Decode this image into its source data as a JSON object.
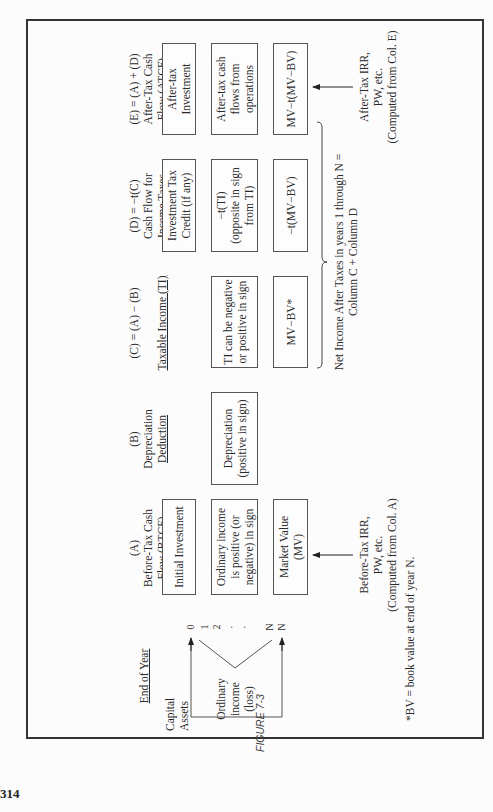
{
  "page_number": "314",
  "figure_label": "FIGURE 7-3",
  "headers": {
    "end_of_year": "End of Year",
    "a": [
      "(A)",
      "Before-Tax Cash",
      "Flow (BTCF)"
    ],
    "b": [
      "(B)",
      "Depreciation",
      "Deduction"
    ],
    "c": [
      "(C) = (A) − (B)",
      "",
      "Taxable Income (TI)"
    ],
    "d": [
      "(D) = −t(C)",
      "Cash Flow for",
      "Income Taxes"
    ],
    "e": [
      "(E) = (A) + (D)",
      "After-Tax Cash",
      "Flow (ATCF)"
    ]
  },
  "years": [
    "0",
    "1",
    "2",
    "·",
    "·",
    "N",
    "N"
  ],
  "capital_assets": "Capital\nAssets",
  "ordinary_income": "Ordinary\nincome\n(loss)",
  "boxes": {
    "a0": "Initial Investment",
    "a1": "Ordinary income\nis positive (or\nnegative) in sign",
    "aN": "Market Value\n(MV)",
    "b1": "Depreciation\n(positive in sign)",
    "c1": "TI can be negative\nor positive in sign",
    "cN": "MV−BV*",
    "d0": "Investment Tax\nCredit (if any)",
    "d1": "−t(TI)\n(opposite in sign\nfrom TI)",
    "dN": "−t(MV−BV)",
    "e0": "After-tax\nInvestment",
    "e1": "After-tax cash\nflows from\noperations",
    "eN": "MV−t(MV−BV)"
  },
  "notes": {
    "before_tax": "Before-Tax IRR,\nPW, etc.\n(Computed from Col. A)",
    "after_tax": "After-Tax IRR,\nPW, etc.\n(Computed from Col. E)",
    "net_income": "Net Income After Taxes in years 1 through N =\nColumn C + Column D",
    "footnote": "*BV = book value at end of year N."
  }
}
